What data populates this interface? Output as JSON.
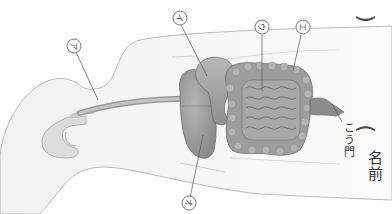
{
  "worksheet": {
    "subject": "human digestive system",
    "orientation": "rotated 90deg clockwise",
    "labels": [
      {
        "id": "a",
        "text": "ア",
        "points_to": "esophagus"
      },
      {
        "id": "i",
        "text": "イ",
        "points_to": "stomach"
      },
      {
        "id": "u",
        "text": "ウ",
        "points_to": "small intestine"
      },
      {
        "id": "e",
        "text": "エ",
        "points_to": "large intestine"
      },
      {
        "id": "o",
        "text": "オ",
        "points_to": "liver"
      }
    ],
    "anus_label": "こう門",
    "name_field": {
      "label": "名前",
      "open_paren": "(",
      "close_paren": ")"
    }
  },
  "colors": {
    "outline": "#9a9a9a",
    "organ_fill": "#a9a9a9",
    "organ_dark": "#7d7d7d",
    "body_fill": "#f4f4f4",
    "leader_line": "#555555"
  }
}
